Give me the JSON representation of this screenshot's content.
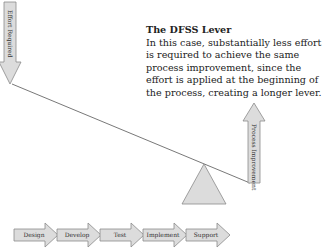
{
  "diagram": {
    "caption": {
      "title": "The DFSS Lever",
      "body": "In this case, substantially less effort is required to achieve the same process improvement, since the effort is applied at the beginning of the process, creating a longer lever."
    },
    "effort_arrow": {
      "label": "Effort Required",
      "direction": "down"
    },
    "improvement_arrow": {
      "label": "Process Improvement",
      "direction": "up"
    },
    "fulcrum": {
      "shape": "triangle"
    },
    "process_steps": [
      {
        "label": "Design"
      },
      {
        "label": "Develop"
      },
      {
        "label": "Test"
      },
      {
        "label": "Implement"
      },
      {
        "label": "Support"
      }
    ],
    "colors": {
      "arrow_fill": "#dcdcdc",
      "arrow_stroke": "#8a8a8a",
      "lever_line": "#555555"
    }
  }
}
